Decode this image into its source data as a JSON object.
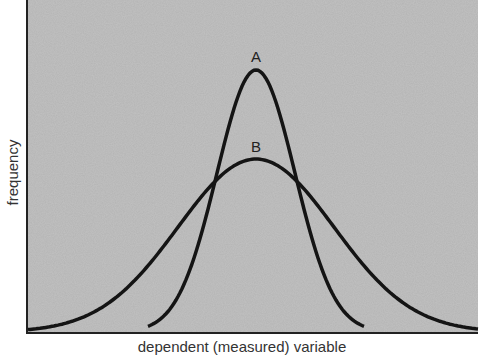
{
  "chart_data": {
    "type": "line",
    "title": "",
    "xlabel": "dependent (measured) variable",
    "ylabel": "frequency",
    "grid": false,
    "legend": "none",
    "annotations": [
      "A",
      "B"
    ],
    "series": [
      {
        "name": "A",
        "distribution": "normal",
        "mean": 0,
        "relative_sd": 0.5,
        "relative_peak": 1.0,
        "description": "narrow, tall bell curve"
      },
      {
        "name": "B",
        "distribution": "normal",
        "mean": 0,
        "relative_sd": 1.0,
        "relative_peak": 0.66,
        "description": "wide, short bell curve"
      }
    ],
    "x": [
      -4,
      -3,
      -2,
      -1,
      0,
      1,
      2,
      3,
      4
    ],
    "values_A": [
      0.0,
      0.0,
      0.0,
      0.13,
      1.0,
      0.13,
      0.0,
      0.0,
      0.0
    ],
    "values_B": [
      0.0,
      0.03,
      0.18,
      0.52,
      0.66,
      0.52,
      0.18,
      0.03,
      0.0
    ]
  },
  "colors": {
    "background": "#b5b5b5",
    "curve": "#141414",
    "axis": "#222222"
  }
}
